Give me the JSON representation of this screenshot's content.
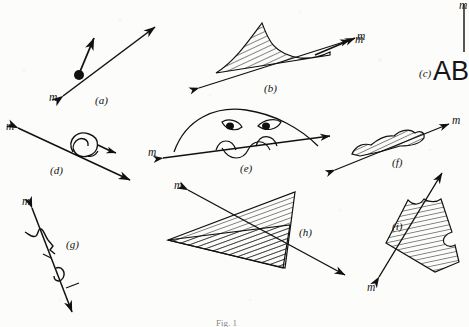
{
  "figure": {
    "caption": "Fig. 1",
    "background_color": "#fcfcfa",
    "ink_color": "#111111",
    "panel_count": 9,
    "vector_label": "m",
    "text_block": "AB",
    "panels": [
      {
        "id": "a",
        "label": "(a)",
        "vector_label": "m",
        "description": "point mass with short velocity arrow and long double-headed axis arrow"
      },
      {
        "id": "b",
        "label": "(b)",
        "vector_label": "m",
        "description": "hatched peaked hill shape above a double-headed arrow"
      },
      {
        "id": "c",
        "label": "(c)",
        "vector_label": "m",
        "description": "single arrow pointing up-right with m at the tip"
      },
      {
        "id": "d",
        "label": "(d)",
        "vector_label": "m",
        "description": "spiral above a double-headed diagonal arrow"
      },
      {
        "id": "e",
        "label": "(e)",
        "vector_label": "m",
        "description": "dome with two eyes and wavy mouth crossed by a double-headed arrow"
      },
      {
        "id": "f",
        "label": "(f)",
        "vector_label": "m",
        "description": "hatched lumpy mound riding a double-headed arrow"
      },
      {
        "id": "g",
        "label": "(g)",
        "vector_label": "m",
        "description": "zigzag line with tick marks along a double-headed arrow"
      },
      {
        "id": "h",
        "label": "(h)",
        "vector_label": "m",
        "description": "two overlapping hatched triangles crossed by a double-headed arrow"
      },
      {
        "id": "i",
        "label": "(i)",
        "vector_label": "m",
        "description": "hatched notched quadrilateral beside a double-headed arrow"
      }
    ]
  }
}
